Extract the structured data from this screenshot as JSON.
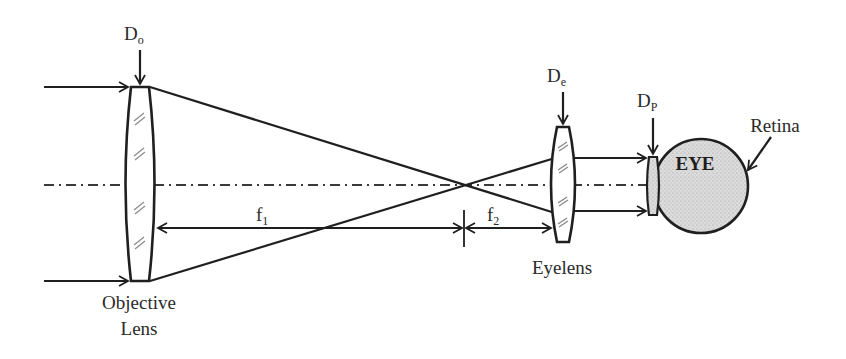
{
  "diagram": {
    "type": "optical-telescope-schematic",
    "labels": {
      "objective_aperture": {
        "main": "D",
        "sub": "o"
      },
      "eyelens_aperture": {
        "main": "D",
        "sub": "e"
      },
      "pupil_aperture": {
        "main": "D",
        "sub": "P"
      },
      "focal_length_1": {
        "main": "f",
        "sub": "1"
      },
      "focal_length_2": {
        "main": "f",
        "sub": "2"
      },
      "objective_lens_line1": "Objective",
      "objective_lens_line2": "Lens",
      "eyelens": "Eyelens",
      "eye": "EYE",
      "retina": "Retina"
    },
    "components": [
      {
        "name": "Objective Lens",
        "aperture": "Do",
        "focal_length": "f1"
      },
      {
        "name": "Eyelens",
        "aperture": "De",
        "focal_length": "f2"
      },
      {
        "name": "Eye pupil",
        "aperture": "Dp"
      },
      {
        "name": "EYE",
        "feature": "Retina"
      }
    ],
    "colors": {
      "line": "#1f1f1f",
      "text": "#2a2a2a",
      "eye_fill": "#d9d9d9",
      "background": "#ffffff"
    }
  }
}
